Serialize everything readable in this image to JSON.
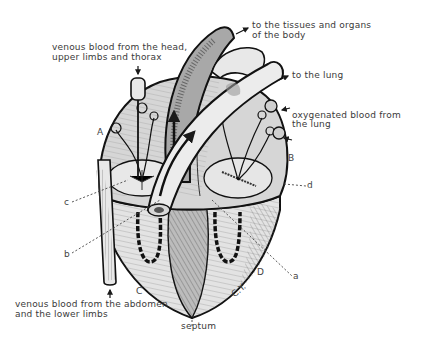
{
  "diagram": {
    "colors": {
      "background": "#ffffff",
      "outline": "#1a1a1a",
      "heart_fill": "#d9d9d9",
      "vessel_dark": "#9a9a9a",
      "vessel_light": "#e8e8e8",
      "text": "#3a3a3a"
    },
    "annotations": {
      "venous_upper_line1": "venous blood from the head,",
      "venous_upper_line2": "upper limbs and thorax",
      "tissues_line1": "to the tissues and organs",
      "tissues_line2": "of the body",
      "to_lung": "to the lung",
      "oxygenated_line1": "oxygenated blood from",
      "oxygenated_line2": "the lung",
      "venous_lower_line1": "venous blood from the abdomen",
      "venous_lower_line2": "and the lower limbs",
      "septum": "septum"
    },
    "region_labels": {
      "A": "A",
      "B": "B",
      "C": "C",
      "D": "D",
      "CY": "C.Y."
    },
    "pointer_labels": {
      "a": "a",
      "b": "b",
      "c": "c",
      "d": "d"
    }
  }
}
